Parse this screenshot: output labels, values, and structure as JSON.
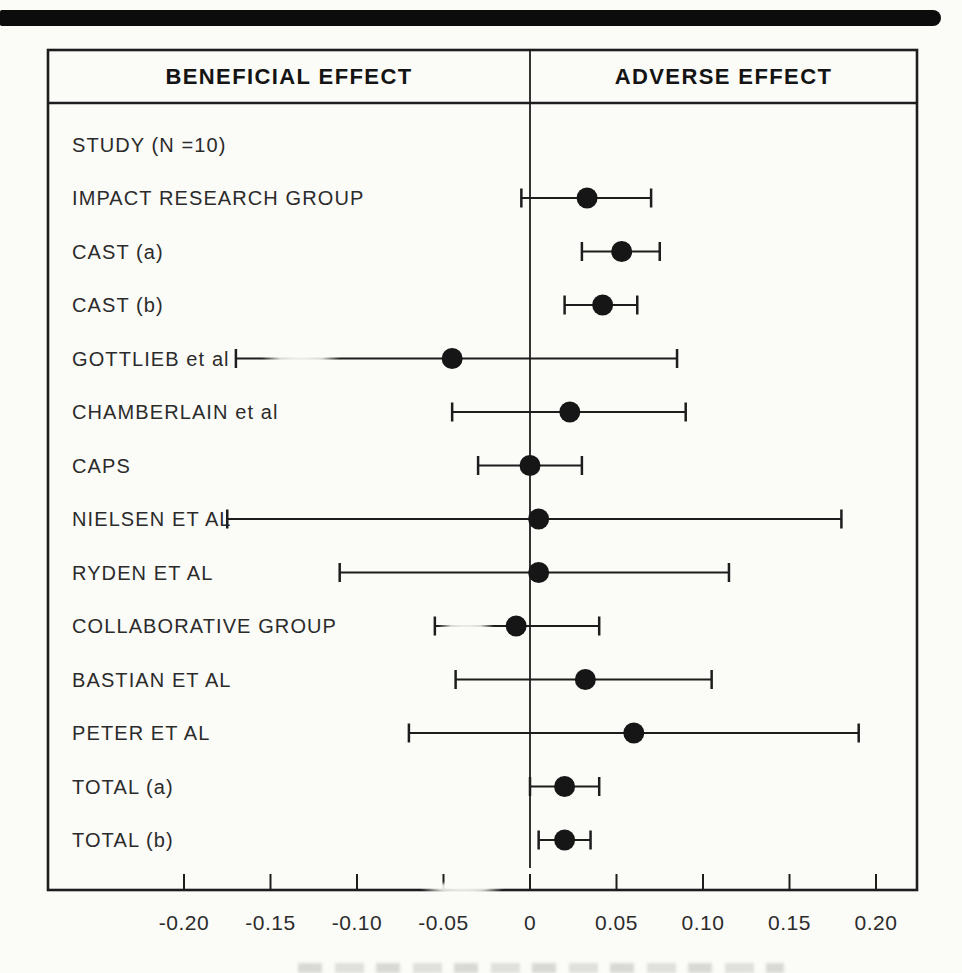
{
  "figure": {
    "header": {
      "left": "BENEFICIAL EFFECT",
      "right": "ADVERSE EFFECT"
    },
    "study_list_label": "STUDY (N =10)"
  },
  "chart_data": {
    "type": "scatter",
    "plot_style": "forest-plot",
    "orientation": "horizontal",
    "grid": false,
    "zero_reference_line": 0,
    "x_axis": {
      "range": [
        -0.28,
        0.225
      ],
      "ticks": [
        -0.2,
        -0.15,
        -0.1,
        -0.05,
        0,
        0.05,
        0.1,
        0.15,
        0.2
      ],
      "tick_labels": [
        "-0.20",
        "-0.15",
        "-0.10",
        "-0.05",
        "0",
        "0.05",
        "0.10",
        "0.15",
        "0.20"
      ]
    },
    "studies": [
      {
        "label": "IMPACT RESEARCH GROUP",
        "value": 0.033,
        "ci_low": -0.005,
        "ci_high": 0.07
      },
      {
        "label": "CAST (a)",
        "value": 0.053,
        "ci_low": 0.03,
        "ci_high": 0.075
      },
      {
        "label": "CAST (b)",
        "value": 0.042,
        "ci_low": 0.02,
        "ci_high": 0.062
      },
      {
        "label": "GOTTLIEB et al",
        "value": -0.045,
        "ci_low": -0.17,
        "ci_high": 0.085
      },
      {
        "label": "CHAMBERLAIN et al",
        "value": 0.023,
        "ci_low": -0.045,
        "ci_high": 0.09
      },
      {
        "label": "CAPS",
        "value": 0.0,
        "ci_low": -0.03,
        "ci_high": 0.03
      },
      {
        "label": "NIELSEN ET AL",
        "value": 0.005,
        "ci_low": -0.175,
        "ci_high": 0.18
      },
      {
        "label": "RYDEN ET AL",
        "value": 0.005,
        "ci_low": -0.11,
        "ci_high": 0.115
      },
      {
        "label": "COLLABORATIVE GROUP",
        "value": -0.008,
        "ci_low": -0.055,
        "ci_high": 0.04
      },
      {
        "label": "BASTIAN ET AL",
        "value": 0.032,
        "ci_low": -0.043,
        "ci_high": 0.105
      },
      {
        "label": "PETER ET AL",
        "value": 0.06,
        "ci_low": -0.07,
        "ci_high": 0.19
      },
      {
        "label": "TOTAL (a)",
        "value": 0.02,
        "ci_low": 0.0,
        "ci_high": 0.04
      },
      {
        "label": "TOTAL (b)",
        "value": 0.02,
        "ci_low": 0.005,
        "ci_high": 0.035
      }
    ],
    "colors": {
      "ink": "#1d1d1d",
      "paper": "#fbfbf8",
      "marker": "#161616"
    }
  },
  "artifacts": {
    "top_scan_bar": true,
    "bottom_caption_cropped_illegible": true
  }
}
